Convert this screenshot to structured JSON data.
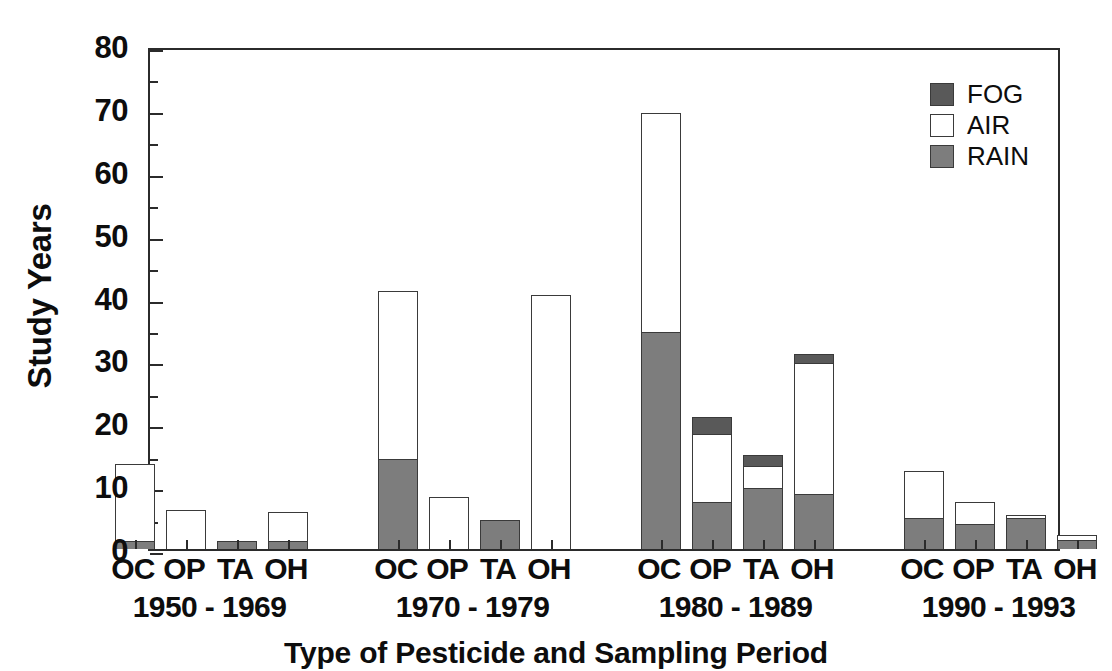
{
  "chart_data": {
    "type": "bar",
    "stacked": true,
    "title": "",
    "xlabel": "Type of Pesticide and Sampling Period",
    "ylabel": "Study Years",
    "ylim": [
      0,
      80
    ],
    "ytick_major": [
      0,
      10,
      20,
      30,
      40,
      50,
      60,
      70,
      80
    ],
    "ytick_minor": [
      5,
      15,
      25,
      35,
      45,
      55,
      65,
      75
    ],
    "ytick_labels": [
      "0",
      "10",
      "20",
      "30",
      "40",
      "50",
      "60",
      "70",
      "80"
    ],
    "grid": false,
    "legend_position": "top-right",
    "legend": [
      {
        "name": "FOG",
        "color": "#595959"
      },
      {
        "name": "AIR",
        "color": "#ffffff"
      },
      {
        "name": "RAIN",
        "color": "#7d7d7d"
      }
    ],
    "categories": [
      "OC",
      "OP",
      "TA",
      "OH"
    ],
    "groups": [
      {
        "period": "1950 - 1969",
        "bars": [
          {
            "category": "OC",
            "RAIN": 1.3,
            "AIR": 12.4,
            "FOG": 0,
            "total": 13.7
          },
          {
            "category": "OP",
            "RAIN": 0,
            "AIR": 6.2,
            "FOG": 0,
            "total": 6.2
          },
          {
            "category": "TA",
            "RAIN": 1.2,
            "AIR": 0,
            "FOG": 0,
            "total": 1.2
          },
          {
            "category": "OH",
            "RAIN": 1.3,
            "AIR": 4.9,
            "FOG": 0,
            "total": 6.2
          }
        ]
      },
      {
        "period": "1970 - 1979",
        "bars": [
          {
            "category": "OC",
            "RAIN": 14.3,
            "AIR": 27.0,
            "FOG": 0,
            "total": 41.3
          },
          {
            "category": "OP",
            "RAIN": 0,
            "AIR": 8.3,
            "FOG": 0,
            "total": 8.3
          },
          {
            "category": "TA",
            "RAIN": 4.6,
            "AIR": 0,
            "FOG": 0,
            "total": 4.6
          },
          {
            "category": "OH",
            "RAIN": 0,
            "AIR": 40.4,
            "FOG": 0,
            "total": 40.4
          }
        ]
      },
      {
        "period": "1980 - 1989",
        "bars": [
          {
            "category": "OC",
            "RAIN": 34.5,
            "AIR": 35.1,
            "FOG": 0,
            "total": 69.6
          },
          {
            "category": "OP",
            "RAIN": 7.5,
            "AIR": 11.0,
            "FOG": 3.0,
            "total": 21.5
          },
          {
            "category": "TA",
            "RAIN": 9.7,
            "AIR": 3.7,
            "FOG": 2.1,
            "total": 15.5
          },
          {
            "category": "OH",
            "RAIN": 8.8,
            "AIR": 21.0,
            "FOG": 1.7,
            "total": 31.5
          }
        ]
      },
      {
        "period": "1990 - 1993",
        "bars": [
          {
            "category": "OC",
            "RAIN": 5.0,
            "AIR": 7.7,
            "FOG": 0,
            "total": 12.7
          },
          {
            "category": "OP",
            "RAIN": 4.0,
            "AIR": 3.7,
            "FOG": 0,
            "total": 7.7
          },
          {
            "category": "TA",
            "RAIN": 5.0,
            "AIR": 0.7,
            "FOG": 0,
            "total": 5.7
          },
          {
            "category": "OH",
            "RAIN": 1.4,
            "AIR": 1.1,
            "FOG": 0,
            "total": 2.5
          }
        ]
      }
    ],
    "colors": {
      "fog": "#595959",
      "air": "#ffffff",
      "rain": "#7d7d7d",
      "outline": "#3a3a3a",
      "axis": "#2b2b2b"
    }
  }
}
